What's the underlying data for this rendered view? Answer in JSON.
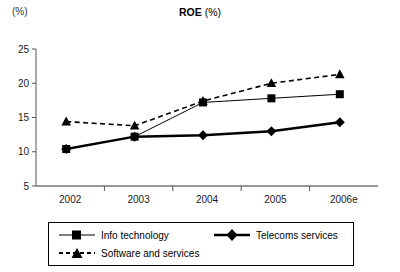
{
  "chart_data": {
    "type": "line",
    "title": "ROE (%)",
    "title_main": "ROE",
    "title_sub": "(%)",
    "unit_label": "(%)",
    "xlabel": "",
    "ylabel": "",
    "categories": [
      "2002",
      "2003",
      "2004",
      "2005",
      "2006e"
    ],
    "ylim": [
      5,
      25
    ],
    "yticks": [
      5,
      10,
      15,
      20,
      25
    ],
    "ytick_labels": [
      "5",
      "10",
      "15",
      "20",
      "25"
    ],
    "grid": false,
    "legend_position": "bottom",
    "series": [
      {
        "name": "Info technology",
        "marker": "square",
        "line_style": "solid",
        "line_width": 1,
        "color": "#000000",
        "values": [
          10.4,
          12.2,
          17.2,
          17.8,
          18.4
        ]
      },
      {
        "name": "Telecoms services",
        "marker": "diamond",
        "line_style": "solid",
        "line_width": 2.4,
        "color": "#000000",
        "values": [
          10.4,
          12.2,
          12.4,
          13.0,
          14.3
        ]
      },
      {
        "name": "Software and services",
        "marker": "triangle",
        "line_style": "dashed",
        "line_width": 1.6,
        "color": "#000000",
        "values": [
          14.4,
          13.8,
          17.4,
          20.0,
          21.3
        ]
      }
    ]
  },
  "legend": {
    "items": [
      {
        "label": "Info technology"
      },
      {
        "label": "Telecoms services"
      },
      {
        "label": "Software and services"
      }
    ]
  }
}
